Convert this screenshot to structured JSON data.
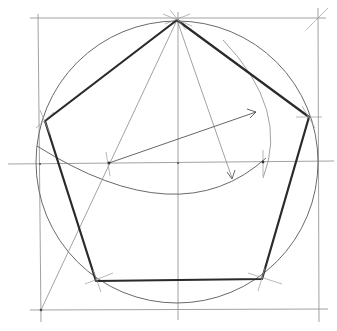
{
  "diagram": {
    "colors": {
      "background": "#ffffff",
      "construction_line": "#8a8a8a",
      "pentagon_edge": "#2a2a2a"
    },
    "circle": {
      "cx": 177,
      "cy": 162,
      "r": 141
    },
    "frame": {
      "left_x": 39,
      "right_x": 318,
      "top_y": 18,
      "bottom_y": 310
    },
    "axes": {
      "horizontal_y": 163,
      "vertical_x": 178
    },
    "pentagon_vertices": [
      {
        "name": "top",
        "x": 177,
        "y": 20
      },
      {
        "name": "right",
        "x": 309,
        "y": 117
      },
      {
        "name": "bottom-right",
        "x": 262,
        "y": 279
      },
      {
        "name": "bottom-left",
        "x": 96,
        "y": 281
      },
      {
        "name": "left",
        "x": 45,
        "y": 121
      }
    ],
    "radius_midpoint": {
      "x": 109,
      "y": 163
    },
    "arc_intersection": {
      "x": 263,
      "y": 162
    }
  }
}
